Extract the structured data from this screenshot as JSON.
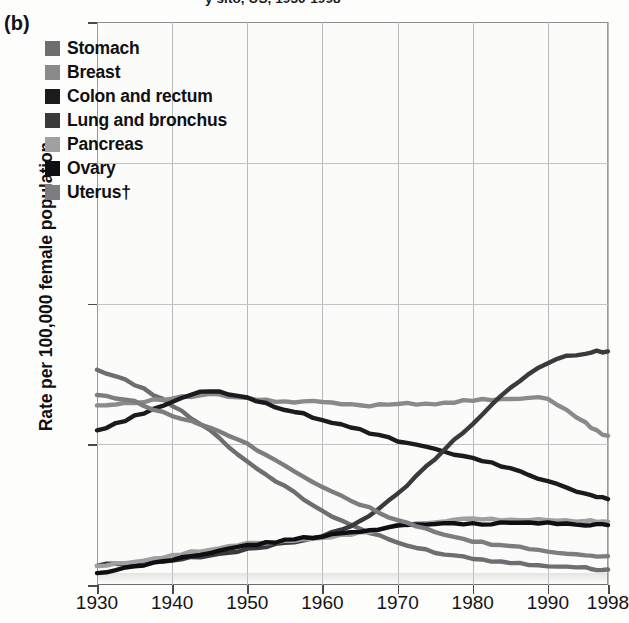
{
  "panel": {
    "label": "(b)"
  },
  "title": "y sito, US, 1930-1998",
  "chart_data": {
    "type": "line",
    "title": "y sito, US, 1930-1998",
    "xlabel": "",
    "ylabel": "Rate per 100,000 female population",
    "xlim": [
      1930,
      1998
    ],
    "ylim": [
      0,
      80
    ],
    "grid": true,
    "legend_position": "upper-left-inside",
    "xticks": [
      "1930",
      "1940",
      "1950",
      "1960",
      "1970",
      "1980",
      "1990",
      "1998"
    ],
    "xtick_values": [
      1930,
      1940,
      1950,
      1960,
      1970,
      1980,
      1990,
      1998
    ],
    "yticks": [
      "0",
      "20",
      "40",
      "60",
      "80"
    ],
    "ytick_values": [
      0,
      20,
      40,
      60,
      80
    ],
    "x": [
      1930,
      1935,
      1940,
      1945,
      1950,
      1955,
      1960,
      1965,
      1970,
      1975,
      1980,
      1985,
      1990,
      1995,
      1998
    ],
    "series": [
      {
        "name": "Stomach",
        "color": "#6e6e70",
        "values": [
          30.5,
          28.5,
          25.5,
          22.0,
          17.5,
          14.0,
          10.5,
          8.0,
          6.0,
          4.7,
          3.8,
          3.2,
          2.8,
          2.4,
          2.2
        ]
      },
      {
        "name": "Breast",
        "color": "#8a8a8c",
        "values": [
          25.5,
          26.0,
          26.5,
          27.0,
          26.5,
          26.0,
          26.0,
          25.5,
          25.8,
          25.8,
          26.2,
          26.5,
          26.3,
          23.0,
          21.2
        ]
      },
      {
        "name": "Colon and rectum",
        "color": "#1b1b1d",
        "values": [
          22.0,
          24.0,
          26.0,
          27.5,
          26.5,
          25.0,
          23.5,
          22.0,
          20.5,
          19.2,
          18.0,
          16.5,
          14.8,
          13.0,
          12.2
        ]
      },
      {
        "name": "Lung and bronchus",
        "color": "#3a3a3c",
        "values": [
          2.8,
          3.2,
          3.6,
          4.2,
          5.0,
          6.0,
          7.0,
          9.0,
          13.0,
          18.0,
          23.0,
          28.0,
          31.5,
          33.0,
          33.2
        ]
      },
      {
        "name": "Pancreas",
        "color": "#a0a0a2",
        "values": [
          2.6,
          3.4,
          4.2,
          5.0,
          5.8,
          6.3,
          6.8,
          7.4,
          8.4,
          9.0,
          9.3,
          9.3,
          9.2,
          9.1,
          9.0
        ]
      },
      {
        "name": "Ovary",
        "color": "#0f0f11",
        "values": [
          1.6,
          2.6,
          3.6,
          4.6,
          5.6,
          6.3,
          7.0,
          7.6,
          8.4,
          8.6,
          8.7,
          8.8,
          8.8,
          8.6,
          8.5
        ]
      },
      {
        "name": "Uterus",
        "color": "#7d7d7f",
        "values": [
          27.0,
          26.0,
          24.0,
          22.5,
          20.0,
          17.0,
          14.0,
          11.5,
          9.2,
          7.5,
          6.2,
          5.5,
          4.8,
          4.3,
          4.1
        ]
      }
    ]
  },
  "legend": {
    "items": [
      {
        "label": "Stomach",
        "color": "#6e6e70"
      },
      {
        "label": "Breast",
        "color": "#8a8a8c"
      },
      {
        "label": "Colon and rectum",
        "color": "#1b1b1d"
      },
      {
        "label": "Lung and bronchus",
        "color": "#3a3a3c"
      },
      {
        "label": "Pancreas",
        "color": "#a0a0a2"
      },
      {
        "label": "Ovary",
        "color": "#0f0f11"
      },
      {
        "label": "Uterus†",
        "color": "#7d7d7f"
      }
    ]
  },
  "axes": {
    "y_title": "Rate per 100,000 female population"
  }
}
